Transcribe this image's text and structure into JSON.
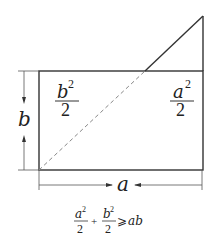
{
  "diagram": {
    "colors": {
      "stroke": "#333333",
      "dashed": "#888888",
      "text": "#222222"
    },
    "labels": {
      "region_left": {
        "numerator_var": "b",
        "exponent": "2",
        "denominator": "2"
      },
      "region_right": {
        "numerator_var": "a",
        "exponent": "2",
        "denominator": "2"
      },
      "side_vertical": "b",
      "side_horizontal": "a"
    },
    "formula": {
      "term1_var": "a",
      "term1_exp": "2",
      "term1_den": "2",
      "plus": "+",
      "term2_var": "b",
      "term2_exp": "2",
      "term2_den": "2",
      "relation": "⩾",
      "rhs": "ab"
    }
  }
}
